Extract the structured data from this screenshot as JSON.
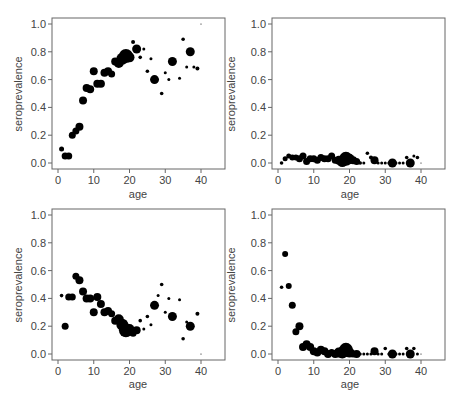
{
  "figure": {
    "layout": "2x2 grid of scatter plots",
    "point_color": "#000000",
    "axis_color": "#666666",
    "text_color": "#444444"
  },
  "chart_data": [
    {
      "id": "top-left",
      "type": "scatter",
      "title": "",
      "xlabel": "age",
      "ylabel": "seroprevalence",
      "xlim": [
        0,
        45
      ],
      "ylim": [
        0,
        1.0
      ],
      "xticks": [
        "0",
        "10",
        "20",
        "30",
        "40"
      ],
      "yticks": [
        "0.0",
        "0.2",
        "0.4",
        "0.6",
        "0.8",
        "1.0"
      ],
      "grid": false,
      "legend": null,
      "marker_size_encodes": "sample size",
      "points": [
        {
          "x": 1,
          "y": 0.1,
          "r": 2.5
        },
        {
          "x": 2,
          "y": 0.05,
          "r": 3.5
        },
        {
          "x": 3,
          "y": 0.05,
          "r": 3.5
        },
        {
          "x": 4,
          "y": 0.2,
          "r": 3.5
        },
        {
          "x": 5,
          "y": 0.23,
          "r": 3.5
        },
        {
          "x": 6,
          "y": 0.26,
          "r": 4
        },
        {
          "x": 7,
          "y": 0.45,
          "r": 4
        },
        {
          "x": 8,
          "y": 0.54,
          "r": 4
        },
        {
          "x": 9,
          "y": 0.53,
          "r": 4
        },
        {
          "x": 10,
          "y": 0.66,
          "r": 4
        },
        {
          "x": 11,
          "y": 0.57,
          "r": 4
        },
        {
          "x": 12,
          "y": 0.57,
          "r": 4
        },
        {
          "x": 13,
          "y": 0.65,
          "r": 4
        },
        {
          "x": 14,
          "y": 0.66,
          "r": 4
        },
        {
          "x": 15,
          "y": 0.64,
          "r": 3.5
        },
        {
          "x": 16,
          "y": 0.73,
          "r": 4
        },
        {
          "x": 17,
          "y": 0.72,
          "r": 5
        },
        {
          "x": 18,
          "y": 0.75,
          "r": 6
        },
        {
          "x": 19,
          "y": 0.77,
          "r": 7
        },
        {
          "x": 20,
          "y": 0.76,
          "r": 5
        },
        {
          "x": 21,
          "y": 0.87,
          "r": 2
        },
        {
          "x": 22,
          "y": 0.82,
          "r": 4.5
        },
        {
          "x": 23,
          "y": 0.76,
          "r": 1.8
        },
        {
          "x": 24,
          "y": 0.82,
          "r": 1.5
        },
        {
          "x": 25,
          "y": 0.66,
          "r": 1.8
        },
        {
          "x": 26,
          "y": 0.75,
          "r": 1.5
        },
        {
          "x": 27,
          "y": 0.6,
          "r": 4.5
        },
        {
          "x": 29,
          "y": 0.5,
          "r": 1.8
        },
        {
          "x": 30,
          "y": 0.65,
          "r": 1.5
        },
        {
          "x": 31,
          "y": 0.6,
          "r": 1.5
        },
        {
          "x": 32,
          "y": 0.73,
          "r": 4.5
        },
        {
          "x": 34,
          "y": 0.61,
          "r": 1.5
        },
        {
          "x": 35,
          "y": 0.89,
          "r": 1.8
        },
        {
          "x": 36,
          "y": 0.69,
          "r": 1.5
        },
        {
          "x": 37,
          "y": 0.8,
          "r": 4.5
        },
        {
          "x": 38,
          "y": 0.69,
          "r": 1.5
        },
        {
          "x": 39,
          "y": 0.68,
          "r": 2
        },
        {
          "x": 40,
          "y": 1.0,
          "r": 0.6
        }
      ]
    },
    {
      "id": "top-right",
      "type": "scatter",
      "title": "",
      "xlabel": "age",
      "ylabel": "seroprevalence",
      "xlim": [
        0,
        45
      ],
      "ylim": [
        0,
        1.0
      ],
      "xticks": [
        "0",
        "10",
        "20",
        "30",
        "40"
      ],
      "yticks": [
        "0.0",
        "0.2",
        "0.4",
        "0.6",
        "0.8",
        "1.0"
      ],
      "grid": false,
      "legend": null,
      "marker_size_encodes": "sample size",
      "points": [
        {
          "x": 1,
          "y": 0.0,
          "r": 1.8
        },
        {
          "x": 2,
          "y": 0.03,
          "r": 2.5
        },
        {
          "x": 3,
          "y": 0.05,
          "r": 2.5
        },
        {
          "x": 4,
          "y": 0.04,
          "r": 3
        },
        {
          "x": 5,
          "y": 0.04,
          "r": 3
        },
        {
          "x": 6,
          "y": 0.03,
          "r": 3.5
        },
        {
          "x": 7,
          "y": 0.05,
          "r": 3.5
        },
        {
          "x": 8,
          "y": 0.01,
          "r": 3.5
        },
        {
          "x": 9,
          "y": 0.03,
          "r": 3.5
        },
        {
          "x": 10,
          "y": 0.03,
          "r": 3.5
        },
        {
          "x": 11,
          "y": 0.02,
          "r": 3.5
        },
        {
          "x": 12,
          "y": 0.04,
          "r": 3.5
        },
        {
          "x": 13,
          "y": 0.03,
          "r": 3.5
        },
        {
          "x": 14,
          "y": 0.03,
          "r": 3.5
        },
        {
          "x": 15,
          "y": 0.05,
          "r": 3.5
        },
        {
          "x": 16,
          "y": 0.02,
          "r": 3.5
        },
        {
          "x": 17,
          "y": 0.02,
          "r": 4.5
        },
        {
          "x": 18,
          "y": 0.01,
          "r": 5.5
        },
        {
          "x": 19,
          "y": 0.03,
          "r": 7
        },
        {
          "x": 20,
          "y": 0.03,
          "r": 5
        },
        {
          "x": 21,
          "y": 0.02,
          "r": 4
        },
        {
          "x": 22,
          "y": 0.01,
          "r": 3.5
        },
        {
          "x": 23,
          "y": 0.0,
          "r": 1.8
        },
        {
          "x": 24,
          "y": 0.0,
          "r": 1.5
        },
        {
          "x": 25,
          "y": 0.07,
          "r": 1.8
        },
        {
          "x": 26,
          "y": 0.04,
          "r": 2
        },
        {
          "x": 27,
          "y": 0.02,
          "r": 4
        },
        {
          "x": 28,
          "y": 0.0,
          "r": 1.5
        },
        {
          "x": 29,
          "y": 0.0,
          "r": 1.5
        },
        {
          "x": 30,
          "y": 0.0,
          "r": 1.5
        },
        {
          "x": 31,
          "y": 0.0,
          "r": 1.5
        },
        {
          "x": 32,
          "y": 0.0,
          "r": 4.5
        },
        {
          "x": 33,
          "y": 0.0,
          "r": 1.5
        },
        {
          "x": 34,
          "y": 0.0,
          "r": 1.5
        },
        {
          "x": 35,
          "y": 0.0,
          "r": 1.5
        },
        {
          "x": 36,
          "y": 0.04,
          "r": 1.8
        },
        {
          "x": 37,
          "y": 0.0,
          "r": 4.5
        },
        {
          "x": 38,
          "y": 0.05,
          "r": 1.5
        },
        {
          "x": 39,
          "y": 0.04,
          "r": 1.8
        },
        {
          "x": 40,
          "y": 0.0,
          "r": 0.6
        }
      ]
    },
    {
      "id": "bottom-left",
      "type": "scatter",
      "title": "",
      "xlabel": "age",
      "ylabel": "seroprevalence",
      "xlim": [
        0,
        45
      ],
      "ylim": [
        0,
        1.0
      ],
      "xticks": [
        "0",
        "10",
        "20",
        "30",
        "40"
      ],
      "yticks": [
        "0.0",
        "0.2",
        "0.4",
        "0.6",
        "0.8",
        "1.0"
      ],
      "grid": false,
      "legend": null,
      "marker_size_encodes": "sample size",
      "points": [
        {
          "x": 1,
          "y": 0.42,
          "r": 1.8
        },
        {
          "x": 2,
          "y": 0.2,
          "r": 3.5
        },
        {
          "x": 3,
          "y": 0.41,
          "r": 3.5
        },
        {
          "x": 4,
          "y": 0.41,
          "r": 3.5
        },
        {
          "x": 5,
          "y": 0.56,
          "r": 3.5
        },
        {
          "x": 6,
          "y": 0.53,
          "r": 4
        },
        {
          "x": 7,
          "y": 0.45,
          "r": 4
        },
        {
          "x": 8,
          "y": 0.4,
          "r": 4
        },
        {
          "x": 9,
          "y": 0.4,
          "r": 4
        },
        {
          "x": 10,
          "y": 0.3,
          "r": 4
        },
        {
          "x": 11,
          "y": 0.41,
          "r": 4
        },
        {
          "x": 12,
          "y": 0.36,
          "r": 4
        },
        {
          "x": 13,
          "y": 0.3,
          "r": 4
        },
        {
          "x": 14,
          "y": 0.31,
          "r": 4
        },
        {
          "x": 15,
          "y": 0.29,
          "r": 3.5
        },
        {
          "x": 16,
          "y": 0.24,
          "r": 4
        },
        {
          "x": 17,
          "y": 0.25,
          "r": 5
        },
        {
          "x": 18,
          "y": 0.21,
          "r": 6
        },
        {
          "x": 19,
          "y": 0.17,
          "r": 7
        },
        {
          "x": 20,
          "y": 0.18,
          "r": 5
        },
        {
          "x": 21,
          "y": 0.15,
          "r": 3.5
        },
        {
          "x": 22,
          "y": 0.17,
          "r": 4
        },
        {
          "x": 23,
          "y": 0.24,
          "r": 1.8
        },
        {
          "x": 24,
          "y": 0.18,
          "r": 1.5
        },
        {
          "x": 25,
          "y": 0.27,
          "r": 1.8
        },
        {
          "x": 26,
          "y": 0.21,
          "r": 1.5
        },
        {
          "x": 27,
          "y": 0.35,
          "r": 4.5
        },
        {
          "x": 28,
          "y": 0.42,
          "r": 1.5
        },
        {
          "x": 29,
          "y": 0.5,
          "r": 1.8
        },
        {
          "x": 30,
          "y": 0.3,
          "r": 1.5
        },
        {
          "x": 31,
          "y": 0.4,
          "r": 1.5
        },
        {
          "x": 32,
          "y": 0.27,
          "r": 4.5
        },
        {
          "x": 34,
          "y": 0.39,
          "r": 1.5
        },
        {
          "x": 35,
          "y": 0.11,
          "r": 1.8
        },
        {
          "x": 36,
          "y": 0.23,
          "r": 1.5
        },
        {
          "x": 37,
          "y": 0.2,
          "r": 4.5
        },
        {
          "x": 39,
          "y": 0.29,
          "r": 2
        },
        {
          "x": 40,
          "y": 0.0,
          "r": 0.6
        }
      ]
    },
    {
      "id": "bottom-right",
      "type": "scatter",
      "title": "",
      "xlabel": "age",
      "ylabel": "seroprevalence",
      "xlim": [
        0,
        45
      ],
      "ylim": [
        0,
        1.0
      ],
      "xticks": [
        "0",
        "10",
        "20",
        "30",
        "40"
      ],
      "yticks": [
        "0.0",
        "0.2",
        "0.4",
        "0.6",
        "0.8",
        "1.0"
      ],
      "grid": false,
      "legend": null,
      "marker_size_encodes": "sample size",
      "points": [
        {
          "x": 1,
          "y": 0.48,
          "r": 1.8
        },
        {
          "x": 2,
          "y": 0.72,
          "r": 3
        },
        {
          "x": 3,
          "y": 0.49,
          "r": 3
        },
        {
          "x": 4,
          "y": 0.35,
          "r": 3.5
        },
        {
          "x": 5,
          "y": 0.16,
          "r": 3.5
        },
        {
          "x": 6,
          "y": 0.2,
          "r": 4
        },
        {
          "x": 7,
          "y": 0.05,
          "r": 4
        },
        {
          "x": 8,
          "y": 0.07,
          "r": 4
        },
        {
          "x": 9,
          "y": 0.05,
          "r": 4
        },
        {
          "x": 10,
          "y": 0.02,
          "r": 4
        },
        {
          "x": 11,
          "y": 0.01,
          "r": 4
        },
        {
          "x": 12,
          "y": 0.03,
          "r": 4
        },
        {
          "x": 13,
          "y": 0.02,
          "r": 4
        },
        {
          "x": 14,
          "y": 0.0,
          "r": 4
        },
        {
          "x": 15,
          "y": 0.01,
          "r": 3.5
        },
        {
          "x": 16,
          "y": 0.0,
          "r": 4
        },
        {
          "x": 17,
          "y": 0.01,
          "r": 5
        },
        {
          "x": 18,
          "y": 0.01,
          "r": 6
        },
        {
          "x": 19,
          "y": 0.03,
          "r": 7
        },
        {
          "x": 20,
          "y": 0.01,
          "r": 5
        },
        {
          "x": 21,
          "y": 0.0,
          "r": 3.5
        },
        {
          "x": 22,
          "y": 0.0,
          "r": 4
        },
        {
          "x": 23,
          "y": 0.0,
          "r": 1.5
        },
        {
          "x": 24,
          "y": 0.0,
          "r": 1.5
        },
        {
          "x": 25,
          "y": 0.0,
          "r": 1.5
        },
        {
          "x": 26,
          "y": 0.0,
          "r": 1.5
        },
        {
          "x": 27,
          "y": 0.02,
          "r": 4
        },
        {
          "x": 28,
          "y": 0.0,
          "r": 1.5
        },
        {
          "x": 29,
          "y": 0.0,
          "r": 1.5
        },
        {
          "x": 30,
          "y": 0.04,
          "r": 1.8
        },
        {
          "x": 31,
          "y": 0.0,
          "r": 1.5
        },
        {
          "x": 32,
          "y": 0.0,
          "r": 4.5
        },
        {
          "x": 33,
          "y": 0.0,
          "r": 1.5
        },
        {
          "x": 34,
          "y": 0.0,
          "r": 1.5
        },
        {
          "x": 35,
          "y": 0.0,
          "r": 1.5
        },
        {
          "x": 36,
          "y": 0.04,
          "r": 1.8
        },
        {
          "x": 37,
          "y": 0.0,
          "r": 4.5
        },
        {
          "x": 38,
          "y": 0.04,
          "r": 1.8
        },
        {
          "x": 39,
          "y": 0.0,
          "r": 1.5
        },
        {
          "x": 40,
          "y": 0.0,
          "r": 0.6
        }
      ]
    }
  ]
}
